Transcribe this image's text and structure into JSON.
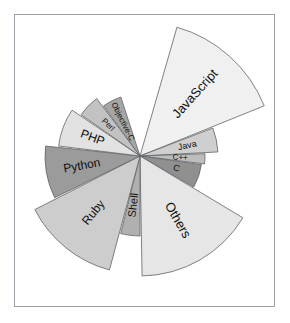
{
  "figure": {
    "title": "",
    "background": "#ffffff",
    "frame_color": "#9aa0a6"
  },
  "chart_data": {
    "type": "pie",
    "variant": "rose-nightingale-polar-area",
    "title": "",
    "subtitle": "",
    "xlabel": "",
    "ylabel": "",
    "legend_position": "none",
    "grid": false,
    "center": {
      "x": 140,
      "y": 156
    },
    "labels": [
      "JavaScript",
      "Java",
      "C++",
      "C",
      "Others",
      "Shell",
      "Ruby",
      "Python",
      "PHP",
      "Perl",
      "Objective-C"
    ],
    "values": [
      134,
      78,
      65,
      62,
      120,
      80,
      118,
      95,
      82,
      72,
      62
    ],
    "slices": [
      {
        "label": "JavaScript",
        "start_angle": -74,
        "end_angle": -22,
        "radius": 134,
        "color": "#f0f0f0"
      },
      {
        "label": "Java",
        "start_angle": -21,
        "end_angle": -3,
        "radius": 78,
        "color": "#cfcfcf"
      },
      {
        "label": "C++",
        "start_angle": -2,
        "end_angle": 7,
        "radius": 65,
        "color": "#bdbdbd"
      },
      {
        "label": "C",
        "start_angle": 8,
        "end_angle": 30,
        "radius": 62,
        "color": "#909090"
      },
      {
        "label": "Others",
        "start_angle": 31,
        "end_angle": 89,
        "radius": 120,
        "color": "#e6e6e6"
      },
      {
        "label": "Shell",
        "start_angle": 90,
        "end_angle": 104,
        "radius": 80,
        "color": "#b0b0b0"
      },
      {
        "label": "Ruby",
        "start_angle": 105,
        "end_angle": 153,
        "radius": 118,
        "color": "#cdcdcd"
      },
      {
        "label": "Python",
        "start_angle": 154,
        "end_angle": 186,
        "radius": 95,
        "color": "#9b9b9b"
      },
      {
        "label": "PHP",
        "start_angle": 187,
        "end_angle": 214,
        "radius": 82,
        "color": "#e2e2e2"
      },
      {
        "label": "Perl",
        "start_angle": 215,
        "end_angle": 233,
        "radius": 72,
        "color": "#c2c2c2"
      },
      {
        "label": "Objective-C",
        "start_angle": 234,
        "end_angle": 252,
        "radius": 62,
        "color": "#a6a6a6"
      }
    ],
    "label_font_sizes": {
      "JavaScript": 13,
      "Others": 13,
      "Ruby": 12,
      "Python": 12,
      "PHP": 12,
      "Shell": 11,
      "Java": 9,
      "Perl": 8,
      "Objective-C": 8,
      "C": 9,
      "C++": 8
    },
    "stroke_color": "#5f6368"
  }
}
